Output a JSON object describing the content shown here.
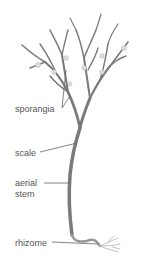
{
  "diagram": {
    "labels": {
      "sporangia": "sporangia",
      "scale": "scale",
      "aerial_stem_line1": "aerial",
      "aerial_stem_line2": "stem",
      "rhizome": "rhizome"
    },
    "colors": {
      "stem": "#7a7a7a",
      "leader": "#666666",
      "sporangia": "#c8c8c8",
      "rhizome": "#b0b0b0",
      "text": "#555555"
    }
  }
}
